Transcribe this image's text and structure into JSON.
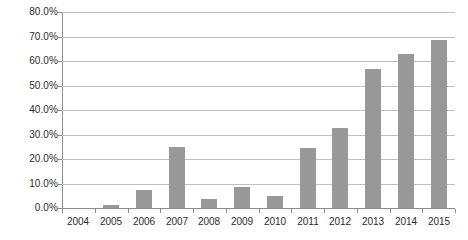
{
  "chart_data": {
    "type": "bar",
    "title": "",
    "subtitle": "",
    "xlabel": "",
    "ylabel": "",
    "categories": [
      "2004",
      "2005",
      "2006",
      "2007",
      "2008",
      "2009",
      "2010",
      "2011",
      "2012",
      "2013",
      "2014",
      "2015"
    ],
    "values": [
      0.0,
      1.1,
      7.2,
      24.8,
      3.6,
      8.5,
      4.8,
      24.3,
      32.5,
      56.9,
      62.8,
      68.7
    ],
    "value_labels": [
      "0.0%",
      "1.1%",
      "7.2%",
      "24.8%",
      "3.6%",
      "8.5%",
      "4.8%",
      "24.3%",
      "32.5%",
      "56.9%",
      "62.8%",
      "68.7%"
    ],
    "ylim": [
      0,
      80
    ],
    "ytick_values": [
      0,
      10,
      20,
      30,
      40,
      50,
      60,
      70,
      80
    ],
    "ytick_labels": [
      "0.0%",
      "10.0%",
      "20.0%",
      "30.0%",
      "40.0%",
      "50.0%",
      "60.0%",
      "70.0%",
      "80.0%"
    ],
    "grid": true,
    "grid_axis": "y",
    "legend": false,
    "legend_position": "none",
    "series": [
      {
        "name": "",
        "values": [
          0.0,
          1.1,
          7.2,
          24.8,
          3.6,
          8.5,
          4.8,
          24.3,
          32.5,
          56.9,
          62.8,
          68.7
        ]
      }
    ]
  },
  "style": {
    "bar_color": "#989898",
    "gridline_color": "#bfbfbf",
    "axis_color": "#8c8c8c",
    "text_color": "#2b2b2b",
    "background": "#ffffff"
  }
}
